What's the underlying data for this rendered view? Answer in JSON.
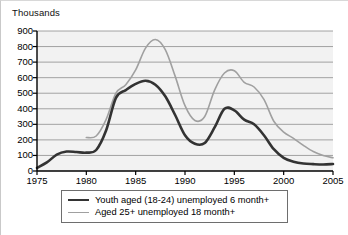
{
  "chart_data": {
    "type": "line",
    "title": "Thousands",
    "xlabel": "",
    "ylabel": "Thousands",
    "xlim": [
      1975,
      2005
    ],
    "ylim": [
      0,
      900
    ],
    "grid": true,
    "legend_position": "bottom",
    "x_ticks": [
      1975,
      1980,
      1985,
      1990,
      1995,
      2000,
      2005
    ],
    "y_ticks": [
      0,
      100,
      200,
      300,
      400,
      500,
      600,
      700,
      800,
      900
    ],
    "series": [
      {
        "name": "Youth aged (18-24) unemployed 6 month+",
        "color": "#333333",
        "width": 2.6,
        "x": [
          1975,
          1976,
          1977,
          1978,
          1979,
          1980,
          1981,
          1982,
          1983,
          1984,
          1985,
          1986,
          1987,
          1988,
          1989,
          1990,
          1991,
          1992,
          1993,
          1994,
          1995,
          1996,
          1997,
          1998,
          1999,
          2000,
          2001,
          2002,
          2003,
          2004,
          2005
        ],
        "values": [
          20,
          55,
          105,
          125,
          122,
          118,
          135,
          260,
          470,
          520,
          560,
          580,
          555,
          480,
          360,
          230,
          175,
          180,
          280,
          400,
          390,
          330,
          300,
          230,
          140,
          85,
          60,
          48,
          44,
          42,
          45
        ]
      },
      {
        "name": "Aged 25+ unemployed 18 month+",
        "color": "#a0a0a0",
        "width": 1.6,
        "x": [
          1980,
          1981,
          1982,
          1983,
          1984,
          1985,
          1986,
          1987,
          1988,
          1989,
          1990,
          1991,
          1992,
          1993,
          1994,
          1995,
          1996,
          1997,
          1998,
          1999,
          2000,
          2001,
          2002,
          2003,
          2004,
          2005
        ],
        "values": [
          215,
          225,
          330,
          500,
          555,
          650,
          790,
          845,
          780,
          610,
          420,
          325,
          350,
          520,
          630,
          645,
          570,
          540,
          460,
          320,
          250,
          210,
          165,
          125,
          100,
          85
        ]
      }
    ]
  },
  "legend": {
    "entries": [
      {
        "label": "Youth aged (18-24) unemployed 6 month+",
        "swatch": "dark"
      },
      {
        "label": "Aged 25+ unemployed 18 month+",
        "swatch": "light"
      }
    ]
  },
  "colors": {
    "plot_background": "#f2f2f2",
    "gridline": "#808080",
    "axis": "#000000",
    "series_dark": "#333333",
    "series_light": "#a0a0a0",
    "page_background": "#ffffff"
  }
}
